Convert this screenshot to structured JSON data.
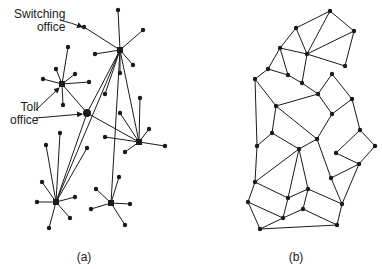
{
  "figure_a": {
    "caption": "(a)",
    "caption_pos": [
      84,
      257
    ],
    "labels": {
      "switching_office": {
        "line1": "Switching",
        "line2": "office",
        "pos": [
          14,
          8
        ]
      },
      "toll_office": {
        "line1": "Toll",
        "line2": "office",
        "pos": [
          10,
          101
        ]
      }
    },
    "arrows": [
      {
        "from": [
          60,
          20
        ],
        "ctrl": [
          72,
          23
        ],
        "to": [
          82,
          27
        ],
        "label": "switching-office-arrow"
      },
      {
        "from": [
          36,
          110
        ],
        "to": [
          59,
          88
        ],
        "label": "toll-office-arrow-1"
      },
      {
        "from": [
          36,
          118
        ],
        "to": [
          82,
          114
        ],
        "label": "toll-office-arrow-2"
      }
    ],
    "hubs": [
      {
        "id": "h1",
        "pos": [
          120,
          50
        ],
        "size": 6
      },
      {
        "id": "h2",
        "pos": [
          62,
          84
        ],
        "size": 6
      },
      {
        "id": "h3",
        "pos": [
          87,
          113
        ],
        "size": 8
      },
      {
        "id": "h4",
        "pos": [
          139,
          142
        ],
        "size": 6
      },
      {
        "id": "h5",
        "pos": [
          56,
          202
        ],
        "size": 6
      },
      {
        "id": "h6",
        "pos": [
          111,
          203
        ],
        "size": 6
      }
    ],
    "trunks": [
      [
        "h3",
        "h1"
      ],
      [
        "h3",
        "h2"
      ],
      [
        "h3",
        "h4"
      ],
      [
        "h3",
        "h5"
      ],
      [
        "h1",
        "h4"
      ],
      [
        "h1",
        "h6"
      ],
      [
        "h1",
        "h5"
      ]
    ],
    "leaves": [
      {
        "hub": "h1",
        "pos": [
          118,
          10
        ]
      },
      {
        "hub": "h1",
        "pos": [
          143,
          30
        ]
      },
      {
        "hub": "h1",
        "pos": [
          84,
          27
        ]
      },
      {
        "hub": "h1",
        "pos": [
          95,
          54
        ]
      },
      {
        "hub": "h1",
        "pos": [
          133,
          65
        ]
      },
      {
        "hub": "h1",
        "pos": [
          120,
          73
        ]
      },
      {
        "hub": "h1",
        "pos": [
          105,
          94
        ]
      },
      {
        "hub": "h2",
        "pos": [
          68,
          47
        ]
      },
      {
        "hub": "h2",
        "pos": [
          56,
          69
        ]
      },
      {
        "hub": "h2",
        "pos": [
          75,
          74
        ]
      },
      {
        "hub": "h2",
        "pos": [
          43,
          79
        ]
      },
      {
        "hub": "h2",
        "pos": [
          89,
          82
        ]
      },
      {
        "hub": "h2",
        "pos": [
          63,
          105
        ]
      },
      {
        "hub": "h4",
        "pos": [
          140,
          98
        ]
      },
      {
        "hub": "h4",
        "pos": [
          120,
          113
        ]
      },
      {
        "hub": "h4",
        "pos": [
          149,
          129
        ]
      },
      {
        "hub": "h4",
        "pos": [
          105,
          137
        ]
      },
      {
        "hub": "h4",
        "pos": [
          165,
          146
        ]
      },
      {
        "hub": "h4",
        "pos": [
          125,
          152
        ]
      },
      {
        "hub": "h5",
        "pos": [
          60,
          133
        ]
      },
      {
        "hub": "h5",
        "pos": [
          46,
          145
        ]
      },
      {
        "hub": "h5",
        "pos": [
          87,
          148
        ]
      },
      {
        "hub": "h5",
        "pos": [
          42,
          182
        ]
      },
      {
        "hub": "h5",
        "pos": [
          37,
          202
        ]
      },
      {
        "hub": "h5",
        "pos": [
          75,
          197
        ]
      },
      {
        "hub": "h5",
        "pos": [
          70,
          218
        ]
      },
      {
        "hub": "h5",
        "pos": [
          49,
          228
        ]
      },
      {
        "hub": "h6",
        "pos": [
          119,
          177
        ]
      },
      {
        "hub": "h6",
        "pos": [
          96,
          189
        ]
      },
      {
        "hub": "h6",
        "pos": [
          91,
          209
        ]
      },
      {
        "hub": "h6",
        "pos": [
          130,
          204
        ]
      },
      {
        "hub": "h6",
        "pos": [
          125,
          225
        ]
      }
    ]
  },
  "figure_b": {
    "caption": "(b)",
    "caption_pos": [
      296,
      257
    ],
    "nodes": {
      "A": [
        330,
        11
      ],
      "B": [
        296,
        28
      ],
      "C": [
        354,
        31
      ],
      "D": [
        280,
        48
      ],
      "E": [
        307,
        54
      ],
      "F": [
        345,
        66
      ],
      "G": [
        268,
        69
      ],
      "H": [
        288,
        75
      ],
      "I": [
        255,
        79
      ],
      "J": [
        302,
        83
      ],
      "K": [
        332,
        74
      ],
      "L": [
        318,
        94
      ],
      "M": [
        352,
        99
      ],
      "N": [
        276,
        106
      ],
      "O": [
        332,
        114
      ],
      "P": [
        272,
        133
      ],
      "Q": [
        360,
        130
      ],
      "R": [
        317,
        139
      ],
      "S": [
        257,
        146
      ],
      "T": [
        299,
        149
      ],
      "U": [
        375,
        146
      ],
      "V": [
        336,
        153
      ],
      "W": [
        359,
        164
      ],
      "X": [
        331,
        178
      ],
      "Y": [
        255,
        182
      ],
      "Z": [
        308,
        189
      ],
      "a": [
        288,
        198
      ],
      "b": [
        248,
        202
      ],
      "c": [
        342,
        204
      ],
      "d": [
        303,
        209
      ],
      "e": [
        283,
        218
      ],
      "f": [
        260,
        229
      ],
      "g": [
        337,
        225
      ]
    },
    "edges": [
      [
        "A",
        "B"
      ],
      [
        "A",
        "C"
      ],
      [
        "A",
        "E"
      ],
      [
        "B",
        "D"
      ],
      [
        "B",
        "E"
      ],
      [
        "C",
        "E"
      ],
      [
        "C",
        "F"
      ],
      [
        "D",
        "E"
      ],
      [
        "E",
        "F"
      ],
      [
        "D",
        "G"
      ],
      [
        "D",
        "H"
      ],
      [
        "E",
        "J"
      ],
      [
        "G",
        "H"
      ],
      [
        "G",
        "I"
      ],
      [
        "H",
        "J"
      ],
      [
        "J",
        "L"
      ],
      [
        "L",
        "K"
      ],
      [
        "K",
        "M"
      ],
      [
        "L",
        "N"
      ],
      [
        "I",
        "N"
      ],
      [
        "I",
        "S"
      ],
      [
        "L",
        "O"
      ],
      [
        "M",
        "O"
      ],
      [
        "N",
        "R"
      ],
      [
        "N",
        "P"
      ],
      [
        "O",
        "R"
      ],
      [
        "M",
        "Q"
      ],
      [
        "P",
        "S"
      ],
      [
        "P",
        "T"
      ],
      [
        "R",
        "T"
      ],
      [
        "R",
        "X"
      ],
      [
        "Q",
        "U"
      ],
      [
        "Q",
        "V"
      ],
      [
        "U",
        "W"
      ],
      [
        "V",
        "W"
      ],
      [
        "T",
        "Y"
      ],
      [
        "T",
        "a"
      ],
      [
        "T",
        "Z"
      ],
      [
        "S",
        "Y"
      ],
      [
        "X",
        "W"
      ],
      [
        "X",
        "c"
      ],
      [
        "Z",
        "c"
      ],
      [
        "Z",
        "d"
      ],
      [
        "Y",
        "b"
      ],
      [
        "Y",
        "a"
      ],
      [
        "a",
        "Z"
      ],
      [
        "a",
        "e"
      ],
      [
        "b",
        "e"
      ],
      [
        "b",
        "f"
      ],
      [
        "e",
        "d"
      ],
      [
        "e",
        "f"
      ],
      [
        "d",
        "g"
      ],
      [
        "c",
        "g"
      ],
      [
        "f",
        "g"
      ],
      [
        "W",
        "c"
      ]
    ]
  },
  "colors": {
    "ink": "#1a1a1a",
    "background": "#ffffff"
  }
}
